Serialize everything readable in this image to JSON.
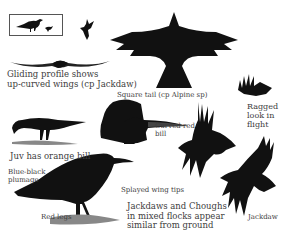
{
  "plate": {
    "subject": "Chough identification plate",
    "colors": {
      "plumage": "#111111",
      "ground": "#8a8a8a",
      "text": "#3d3d3d",
      "background": "#ffffff"
    }
  },
  "labels": {
    "gliding": [
      "Gliding profile shows",
      "up-curved wings (cp Jackdaw)"
    ],
    "square_tail": "Square tail (cp Alpine sp)",
    "curved_bill": [
      "Curved red",
      "bill"
    ],
    "ragged": [
      "Ragged",
      "look in",
      "flight"
    ],
    "juv": "Juv has orange bill",
    "blue_black": [
      "Blue-black",
      "plumage"
    ],
    "splayed": "Splayed wing tips",
    "red_legs": "Red legs",
    "mixed_flocks": [
      "Jackdaws and Choughs",
      "in mixed flocks appear",
      "similar from ground"
    ],
    "jackdaw": "Jackdaw"
  },
  "figures": [
    {
      "name": "inset-chough-and-jackdaw-size-comparison"
    },
    {
      "name": "small-flying-chough"
    },
    {
      "name": "gliding-profile"
    },
    {
      "name": "large-flying-chough-from-below"
    },
    {
      "name": "tail-detail"
    },
    {
      "name": "head-bill-detail"
    },
    {
      "name": "ragged-flying-chough"
    },
    {
      "name": "juvenile-foraging-chough"
    },
    {
      "name": "standing-adult-chough"
    },
    {
      "name": "splayed-wing-chough-flight"
    },
    {
      "name": "jackdaw-flight"
    }
  ]
}
